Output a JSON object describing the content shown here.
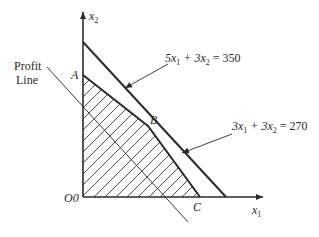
{
  "axes": {
    "x_label": "x",
    "x_sub": "1",
    "y_label": "x",
    "y_sub": "2",
    "origin_label": "O0"
  },
  "points": {
    "A": "A",
    "B": "B",
    "C": "C"
  },
  "constraints": [
    {
      "id": "c1",
      "label_parts": [
        "5x",
        "1",
        " + 3x",
        "2",
        " = 350"
      ],
      "coef1": 5,
      "coef2": 3,
      "rhs": 350
    },
    {
      "id": "c2",
      "label_parts": [
        "3x",
        "1",
        " + 3x",
        "2",
        " = 270"
      ],
      "coef1": 3,
      "coef2": 3,
      "rhs": 270
    }
  ],
  "profit_line": {
    "label_line1": "Profit",
    "label_line2": "Line"
  },
  "colors": {
    "line": "#2a2a2a",
    "hatch": "#3a3a3a",
    "background": "#ffffff"
  }
}
